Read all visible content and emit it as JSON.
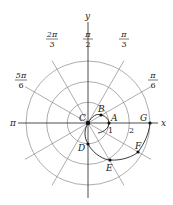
{
  "diagram": {
    "type": "polar-graph",
    "axes": {
      "x_label": "x",
      "y_label": "y"
    },
    "angle_labels": [
      {
        "id": "pi-over-2",
        "num": "π",
        "den": "2"
      },
      {
        "id": "pi-over-3",
        "num": "π",
        "den": "3"
      },
      {
        "id": "pi-over-6",
        "num": "π",
        "den": "6"
      },
      {
        "id": "2pi-over-3",
        "num": "2π",
        "den": "3"
      },
      {
        "id": "5pi-over-6",
        "num": "5π",
        "den": "6"
      },
      {
        "id": "pi",
        "text": "π"
      }
    ],
    "radius_labels": [
      "1",
      "2"
    ],
    "points": [
      {
        "id": "A",
        "label": "A"
      },
      {
        "id": "B",
        "label": "B"
      },
      {
        "id": "C",
        "label": "C"
      },
      {
        "id": "D",
        "label": "D"
      },
      {
        "id": "E",
        "label": "E"
      },
      {
        "id": "F",
        "label": "F"
      },
      {
        "id": "G",
        "label": "G"
      }
    ],
    "colors": {
      "grid": "#8a8a8a",
      "axis": "#222222",
      "curve": "#222222",
      "point": "#111111"
    }
  }
}
